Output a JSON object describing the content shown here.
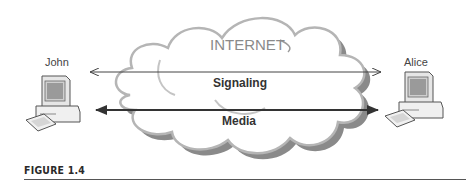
{
  "diagram": {
    "cloud_label": "INTERNET",
    "left_node": {
      "label": "John",
      "icon": "desktop-computer-icon"
    },
    "right_node": {
      "label": "Alice",
      "icon": "desktop-computer-icon"
    },
    "links": [
      {
        "label": "Signaling",
        "style": "thin",
        "direction": "bidirectional"
      },
      {
        "label": "Media",
        "style": "thick",
        "direction": "bidirectional"
      }
    ]
  },
  "caption": {
    "label": "FIGURE 1.4"
  },
  "colors": {
    "cloud_fill": "#ffffff",
    "cloud_stroke_light": "#b0b0b0",
    "cloud_stroke_dark": "#7a7a7a",
    "arrow": "#333333",
    "text": "#444444"
  }
}
